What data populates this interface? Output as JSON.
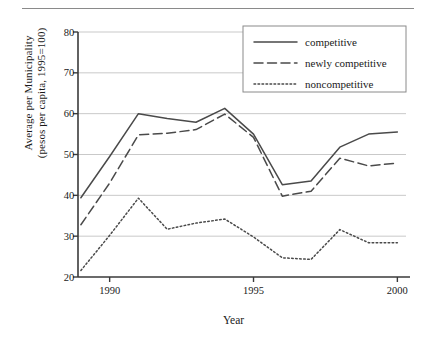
{
  "figure": {
    "ylabel_line1": "Average per Municipality",
    "ylabel_line2": "(pesos per capita, 1995=100)",
    "xlabel": "Year"
  },
  "chart_data": {
    "type": "line",
    "title": "",
    "xlabel": "Year",
    "ylabel": "Average per Municipality (pesos per capita, 1995=100)",
    "xlim": [
      1988.9,
      2000.3
    ],
    "ylim": [
      20,
      80
    ],
    "xticks": [
      1990,
      1995,
      2000
    ],
    "yticks": [
      20,
      30,
      40,
      50,
      60,
      70,
      80
    ],
    "grid": "horizontal",
    "legend_position": "top-right",
    "x": [
      1989,
      1990,
      1991,
      1992,
      1993,
      1994,
      1995,
      1996,
      1997,
      1998,
      1999,
      2000
    ],
    "series": [
      {
        "name": "competitive",
        "style": "solid",
        "color": "#4a4a4a",
        "values": [
          39.4,
          49.5,
          60.0,
          58.8,
          57.9,
          61.3,
          55.0,
          42.6,
          43.5,
          51.8,
          55.0,
          55.5
        ]
      },
      {
        "name": "newly competitive",
        "style": "dashed",
        "color": "#4a4a4a",
        "values": [
          32.8,
          43.0,
          54.8,
          55.2,
          56.1,
          59.9,
          54.2,
          39.8,
          41.0,
          49.1,
          47.2,
          47.9
        ]
      },
      {
        "name": "noncompetitive",
        "style": "dotted",
        "color": "#4a4a4a",
        "values": [
          21.6,
          30.2,
          39.3,
          31.7,
          33.2,
          34.2,
          29.8,
          24.7,
          24.3,
          31.6,
          28.4,
          28.4
        ]
      }
    ]
  },
  "legend": {
    "items": [
      {
        "label": "competitive",
        "style": "solid"
      },
      {
        "label": "newly competitive",
        "style": "dashed"
      },
      {
        "label": "noncompetitive",
        "style": "dotted"
      }
    ]
  },
  "axis": {
    "ytick_labels": [
      "20",
      "30",
      "40",
      "50",
      "60",
      "70",
      "80"
    ],
    "xtick_labels": [
      "1990",
      "1995",
      "2000"
    ]
  }
}
